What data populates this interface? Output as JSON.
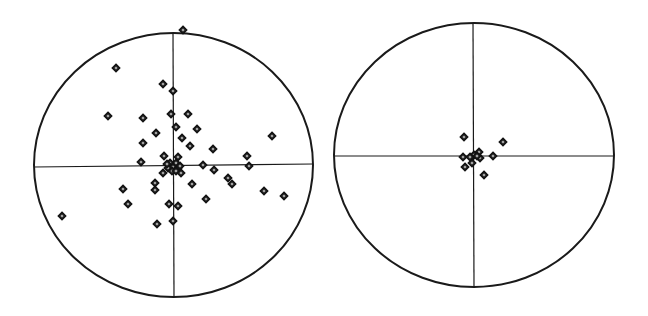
{
  "chart_data": [
    {
      "type": "scatter",
      "title": "",
      "xlabel": "",
      "ylabel": "",
      "grid": false,
      "legend": null,
      "frame": "ellipse",
      "axes": "crosshair",
      "marker": "diamond",
      "center_px": [
        173.5,
        165
      ],
      "radius_px": [
        139.5,
        132
      ],
      "points_px": [
        [
          183,
          30
        ],
        [
          116,
          68
        ],
        [
          163,
          84
        ],
        [
          173,
          91
        ],
        [
          108,
          116
        ],
        [
          143,
          118
        ],
        [
          171,
          114
        ],
        [
          188,
          114
        ],
        [
          176,
          127
        ],
        [
          197,
          129
        ],
        [
          156,
          133
        ],
        [
          272,
          136
        ],
        [
          182,
          138
        ],
        [
          143,
          143
        ],
        [
          190,
          146
        ],
        [
          213,
          149
        ],
        [
          164,
          156
        ],
        [
          178,
          157
        ],
        [
          247,
          156
        ],
        [
          141,
          162
        ],
        [
          170,
          163
        ],
        [
          176,
          163
        ],
        [
          173,
          167
        ],
        [
          168,
          168
        ],
        [
          178,
          168
        ],
        [
          172,
          171
        ],
        [
          176,
          171
        ],
        [
          180,
          166
        ],
        [
          167,
          164
        ],
        [
          203,
          165
        ],
        [
          249,
          166
        ],
        [
          214,
          170
        ],
        [
          163,
          173
        ],
        [
          181,
          173
        ],
        [
          228,
          178
        ],
        [
          155,
          183
        ],
        [
          192,
          184
        ],
        [
          232,
          184
        ],
        [
          123,
          189
        ],
        [
          155,
          190
        ],
        [
          264,
          191
        ],
        [
          284,
          196
        ],
        [
          206,
          199
        ],
        [
          128,
          204
        ],
        [
          169,
          204
        ],
        [
          178,
          206
        ],
        [
          62,
          216
        ],
        [
          173,
          221
        ],
        [
          157,
          224
        ]
      ]
    },
    {
      "type": "scatter",
      "title": "",
      "xlabel": "",
      "ylabel": "",
      "grid": false,
      "legend": null,
      "frame": "ellipse",
      "axes": "crosshair",
      "marker": "diamond",
      "center_px": [
        474,
        155
      ],
      "radius_px": [
        140,
        132
      ],
      "points_px": [
        [
          464,
          137
        ],
        [
          503,
          142
        ],
        [
          463,
          157
        ],
        [
          474,
          155
        ],
        [
          479,
          152
        ],
        [
          480,
          158
        ],
        [
          493,
          156
        ],
        [
          472,
          163
        ],
        [
          465,
          167
        ],
        [
          484,
          175
        ],
        [
          470,
          157
        ],
        [
          477,
          156
        ]
      ]
    }
  ],
  "colors": {
    "line": "#1a1a1a",
    "marker_fill": "#3a3a3a",
    "marker_stroke": "#111111",
    "background": "#ffffff"
  }
}
